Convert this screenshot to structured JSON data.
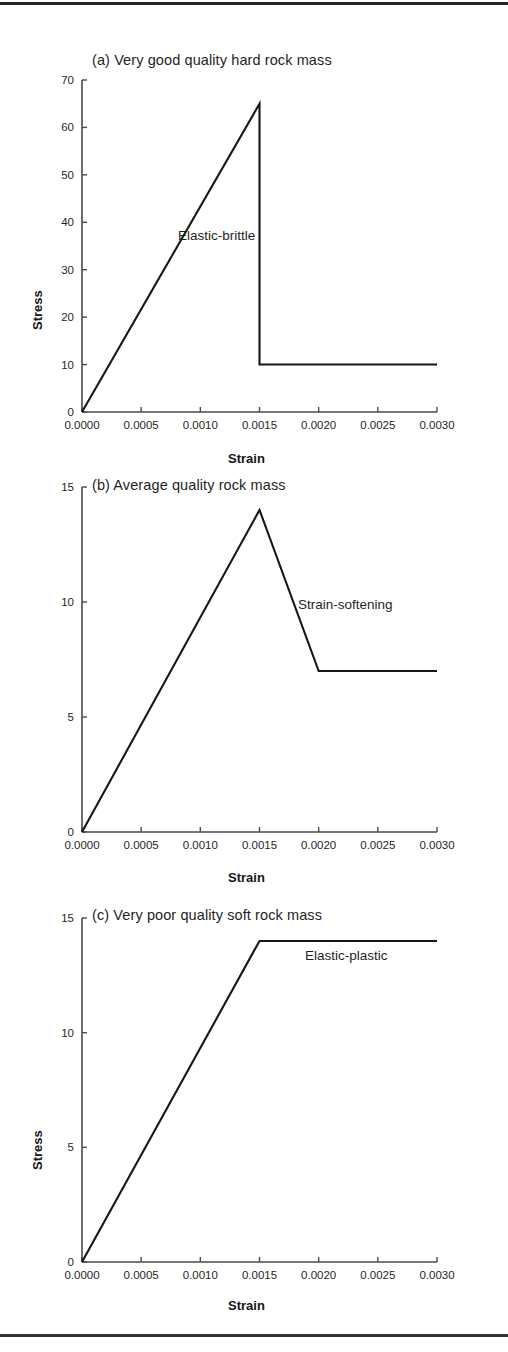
{
  "figure": {
    "background": "#ffffff",
    "line_color": "#161616",
    "axis_color": "#4a4a4a",
    "rule_top": true,
    "rule_bottom": true
  },
  "axis_labels": {
    "x": "Strain",
    "y": "Stress"
  },
  "panels": [
    {
      "id": "a",
      "title": "(a) Very good quality hard rock mass",
      "note": "Elastic-brittle"
    },
    {
      "id": "b",
      "title": "(b) Average quality rock mass",
      "note": "Strain-softening"
    },
    {
      "id": "c",
      "title": "(c) Very poor quality soft rock mass",
      "note": "Elastic-plastic"
    }
  ],
  "chart_data": [
    {
      "type": "line",
      "title": "(a) Very good quality hard rock mass",
      "xlabel": "Strain",
      "ylabel": "Stress",
      "xlim": [
        0.0,
        0.003
      ],
      "ylim": [
        0,
        70
      ],
      "xticks": [
        0.0,
        0.0005,
        0.001,
        0.0015,
        0.002,
        0.0025,
        0.003
      ],
      "xticklabels": [
        "0.0000",
        "0.0005",
        "0.0010",
        "0.0015",
        "0.0020",
        "0.0025",
        "0.0030"
      ],
      "yticks": [
        0,
        10,
        20,
        30,
        40,
        50,
        60,
        70
      ],
      "yticklabels": [
        "0",
        "10",
        "20",
        "30",
        "40",
        "50",
        "60",
        "70"
      ],
      "grid": false,
      "legend": "none",
      "annotations": [
        {
          "text": "Elastic-brittle",
          "x": 0.00165,
          "y": 37
        }
      ],
      "series": [
        {
          "name": "Elastic-brittle",
          "x": [
            0.0,
            0.0015,
            0.0015,
            0.003
          ],
          "y": [
            0,
            65,
            10,
            10
          ]
        }
      ]
    },
    {
      "type": "line",
      "title": "(b) Average quality rock mass",
      "xlabel": "Strain",
      "ylabel": "Stress",
      "xlim": [
        0.0,
        0.003
      ],
      "ylim": [
        0,
        15
      ],
      "xticks": [
        0.0,
        0.0005,
        0.001,
        0.0015,
        0.002,
        0.0025,
        0.003
      ],
      "xticklabels": [
        "0.0000",
        "0.0005",
        "0.0010",
        "0.0015",
        "0.0020",
        "0.0025",
        "0.0030"
      ],
      "yticks": [
        0,
        5,
        10,
        15
      ],
      "yticklabels": [
        "0",
        "5",
        "10",
        "15"
      ],
      "grid": false,
      "legend": "none",
      "annotations": [
        {
          "text": "Strain-softening",
          "x": 0.00185,
          "y": 10.2
        }
      ],
      "series": [
        {
          "name": "Strain-softening",
          "x": [
            0.0,
            0.0015,
            0.002,
            0.003
          ],
          "y": [
            0,
            14,
            7,
            7
          ]
        }
      ]
    },
    {
      "type": "line",
      "title": "(c) Very poor quality soft rock mass",
      "xlabel": "Strain",
      "ylabel": "Stress",
      "xlim": [
        0.0,
        0.003
      ],
      "ylim": [
        0,
        15
      ],
      "xticks": [
        0.0,
        0.0005,
        0.001,
        0.0015,
        0.002,
        0.0025,
        0.003
      ],
      "xticklabels": [
        "0.0000",
        "0.0005",
        "0.0010",
        "0.0015",
        "0.0020",
        "0.0025",
        "0.0030"
      ],
      "yticks": [
        0,
        5,
        10,
        15
      ],
      "yticklabels": [
        "0",
        "5",
        "10",
        "15"
      ],
      "grid": false,
      "legend": "none",
      "annotations": [
        {
          "text": "Elastic-plastic",
          "x": 0.0019,
          "y": 13.1
        }
      ],
      "series": [
        {
          "name": "Elastic-plastic",
          "x": [
            0.0,
            0.0015,
            0.003
          ],
          "y": [
            0,
            14,
            14
          ]
        }
      ]
    }
  ]
}
